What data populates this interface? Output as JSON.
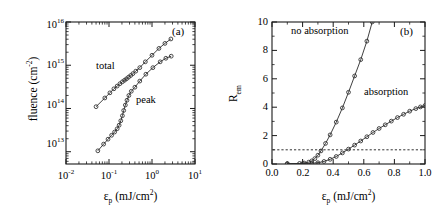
{
  "figure": {
    "width": 440,
    "height": 219,
    "background": "#ffffff",
    "ink_color": "#1a1a1a"
  },
  "panels": [
    {
      "tag": "(a)",
      "tag_name": "panel-a-label",
      "plot_type": "log-log scatter with connecting lines",
      "frame": {
        "left": 66,
        "right": 195,
        "top": 22,
        "bottom": 164
      },
      "x_axis": {
        "label_base": "ε",
        "label_sub": "p",
        "label_rest": " (mJ/cm",
        "label_sup": "2",
        "label_close": ")",
        "label_full": "εp (mJ/cm2)",
        "scale": "log",
        "min_exp": -2,
        "max_exp": 1,
        "tick_labels": [
          "10-2",
          "10-1",
          "100",
          "101"
        ],
        "tick_mantissa": [
          "10",
          "10",
          "10",
          "10"
        ],
        "tick_exponents": [
          "-2",
          "-1",
          "0",
          "1"
        ]
      },
      "y_axis": {
        "label": "fluence (cm",
        "label_sup": "-2",
        "label_close": ")",
        "label_full": "fluence (cm-2)",
        "scale": "log",
        "min_exp": 12.72,
        "max_exp": 16.0,
        "tick_labels": [
          "1013",
          "1014",
          "1015",
          "1016"
        ],
        "tick_mantissa": [
          "10",
          "10",
          "10",
          "10"
        ],
        "tick_exponents": [
          "13",
          "14",
          "15",
          "16"
        ]
      }
    },
    {
      "tag": "(b)",
      "tag_name": "panel-b-label",
      "plot_type": "linear scatter with connecting lines",
      "frame": {
        "left": 272,
        "right": 425,
        "top": 22,
        "bottom": 164
      },
      "x_axis": {
        "label_base": "ε",
        "label_sub": "p",
        "label_rest": " (mJ/cm",
        "label_sup": "2",
        "label_close": ")",
        "label_full": "εp (mJ/cm2)",
        "scale": "linear",
        "min": 0.0,
        "max": 1.0,
        "tick_labels": [
          "0.0",
          "0.2",
          "0.4",
          "0.6",
          "0.8",
          "1.0"
        ],
        "tick_values": [
          0.0,
          0.2,
          0.4,
          0.6,
          0.8,
          1.0
        ]
      },
      "y_axis": {
        "label_base": "R",
        "label_sub": "em",
        "label_full": "Rem",
        "scale": "linear",
        "min": 0,
        "max": 10,
        "tick_labels": [
          "0",
          "2",
          "4",
          "6",
          "8",
          "10"
        ],
        "tick_values": [
          0,
          2,
          4,
          6,
          8,
          10
        ]
      }
    }
  ],
  "chart_data": [
    {
      "type": "scatter",
      "panel": "(a)",
      "title": "",
      "xlabel": "εp (mJ/cm2)",
      "ylabel": "fluence (cm-2)",
      "xscale": "log",
      "yscale": "log",
      "xlim": [
        0.01,
        10
      ],
      "ylim": [
        5200000000000.0,
        1e+16
      ],
      "grid": false,
      "marker": "open-circle",
      "legend": "inline-annotations",
      "series": [
        {
          "name": "total",
          "label_position": {
            "x": 0.13,
            "y": 700000000000000.0
          },
          "points": [
            [
              0.05,
              110000000000000.0
            ],
            [
              0.08,
              175000000000000.0
            ],
            [
              0.105,
              230000000000000.0
            ],
            [
              0.13,
              285000000000000.0
            ],
            [
              0.155,
              330000000000000.0
            ],
            [
              0.18,
              375000000000000.0
            ],
            [
              0.205,
              415000000000000.0
            ],
            [
              0.23,
              450000000000000.0
            ],
            [
              0.255,
              485000000000000.0
            ],
            [
              0.285,
              530000000000000.0
            ],
            [
              0.32,
              580000000000000.0
            ],
            [
              0.36,
              640000000000000.0
            ],
            [
              0.42,
              730000000000000.0
            ],
            [
              0.52,
              880000000000000.0
            ],
            [
              0.7,
              1200000000000000.0
            ],
            [
              1.0,
              1700000000000000.0
            ],
            [
              1.45,
              2450000000000000.0
            ],
            [
              2.0,
              3200000000000000.0
            ],
            [
              2.75,
              4050000000000000.0
            ]
          ]
        },
        {
          "name": "peak",
          "label_position": {
            "x": 0.42,
            "y": 200000000000000.0
          },
          "points": [
            [
              0.055,
              10500000000000.0
            ],
            [
              0.075,
              15000000000000.0
            ],
            [
              0.095,
              19500000000000.0
            ],
            [
              0.115,
              24000000000000.0
            ],
            [
              0.135,
              28500000000000.0
            ],
            [
              0.155,
              34000000000000.0
            ],
            [
              0.172,
              41000000000000.0
            ],
            [
              0.188,
              52000000000000.0
            ],
            [
              0.205,
              68000000000000.0
            ],
            [
              0.22,
              90000000000000.0
            ],
            [
              0.24,
              120000000000000.0
            ],
            [
              0.262,
              155000000000000.0
            ],
            [
              0.29,
              200000000000000.0
            ],
            [
              0.33,
              250000000000000.0
            ],
            [
              0.4,
              310000000000000.0
            ],
            [
              0.52,
              430000000000000.0
            ],
            [
              0.72,
              620000000000000.0
            ],
            [
              1.05,
              880000000000000.0
            ],
            [
              1.55,
              1200000000000000.0
            ],
            [
              2.1,
              1450000000000000.0
            ],
            [
              2.8,
              1620000000000000.0
            ]
          ]
        }
      ]
    },
    {
      "type": "scatter",
      "panel": "(b)",
      "title": "",
      "xlabel": "εp (mJ/cm2)",
      "ylabel": "Rem",
      "xscale": "linear",
      "yscale": "linear",
      "xlim": [
        0.0,
        1.0
      ],
      "ylim": [
        0,
        10
      ],
      "grid": false,
      "marker": "open-circle",
      "legend": "inline-annotations",
      "reference_line": {
        "name": "unity-threshold",
        "orientation": "horizontal",
        "value": 1.0,
        "style": "dotted"
      },
      "series": [
        {
          "name": "no absorption",
          "label_position": {
            "x": 0.2,
            "y": 9.35
          },
          "points": [
            [
              0.1,
              0.02
            ],
            [
              0.18,
              0.04
            ],
            [
              0.21,
              0.07
            ],
            [
              0.24,
              0.13
            ],
            [
              0.26,
              0.22
            ],
            [
              0.28,
              0.38
            ],
            [
              0.3,
              0.62
            ],
            [
              0.32,
              0.92
            ],
            [
              0.35,
              1.45
            ],
            [
              0.38,
              2.05
            ],
            [
              0.42,
              2.95
            ],
            [
              0.46,
              3.95
            ],
            [
              0.5,
              5.05
            ],
            [
              0.54,
              6.2
            ],
            [
              0.58,
              7.35
            ],
            [
              0.62,
              8.65
            ],
            [
              0.655,
              10.0
            ]
          ]
        },
        {
          "name": "absorption",
          "label_position": {
            "x": 0.72,
            "y": 4.7
          },
          "points": [
            [
              0.1,
              0.02
            ],
            [
              0.2,
              0.03
            ],
            [
              0.26,
              0.05
            ],
            [
              0.3,
              0.09
            ],
            [
              0.34,
              0.18
            ],
            [
              0.38,
              0.33
            ],
            [
              0.42,
              0.53
            ],
            [
              0.46,
              0.78
            ],
            [
              0.5,
              1.05
            ],
            [
              0.54,
              1.33
            ],
            [
              0.58,
              1.62
            ],
            [
              0.62,
              1.92
            ],
            [
              0.66,
              2.22
            ],
            [
              0.7,
              2.5
            ],
            [
              0.74,
              2.76
            ],
            [
              0.78,
              3.02
            ],
            [
              0.82,
              3.27
            ],
            [
              0.86,
              3.5
            ],
            [
              0.9,
              3.72
            ],
            [
              0.94,
              3.9
            ],
            [
              0.97,
              4.02
            ],
            [
              1.0,
              4.12
            ]
          ]
        }
      ]
    }
  ],
  "annotations": {
    "panel_a_total": "total",
    "panel_a_peak": "peak",
    "panel_b_no_absorption": "no absorption",
    "panel_b_absorption": "absorption",
    "panel_a_tag": "(a)",
    "panel_b_tag": "(b)"
  }
}
